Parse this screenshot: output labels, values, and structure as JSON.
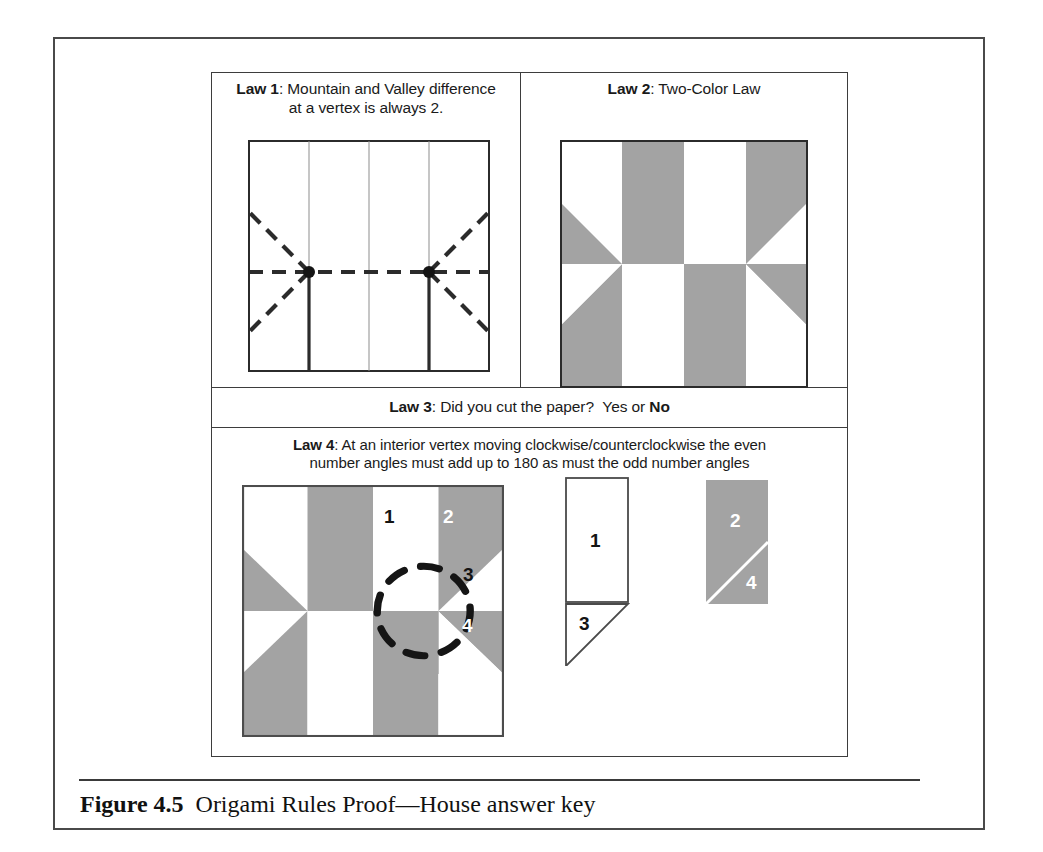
{
  "figure": {
    "caption_label": "Figure 4.5",
    "caption_text": "Origami Rules Proof—House answer key"
  },
  "colors": {
    "gray_fill": "#a3a3a3",
    "line": "#2b2b2b",
    "frame": "#4a4a4a",
    "white": "#ffffff"
  },
  "laws": {
    "law1": {
      "tag": "Law 1",
      "sep": ": ",
      "text_line1": "Mountain and Valley difference",
      "text_line2": "at a vertex is always 2.",
      "diagram": {
        "type": "crease-pattern",
        "columns": 4,
        "vertices": 2,
        "mountain_color": "#2b2b2b",
        "valley_style": "dashed"
      }
    },
    "law2": {
      "tag": "Law 2",
      "sep": ": ",
      "text_line1": "Two-Color Law",
      "diagram": {
        "type": "two-color-grid",
        "columns": 4,
        "rows": 2
      }
    },
    "law3": {
      "tag": "Law 3",
      "sep": ": ",
      "question": "Did you cut the paper?",
      "answer_prefix": "Yes or ",
      "answer": "No"
    },
    "law4": {
      "tag": "Law 4",
      "sep": ": ",
      "text_line1": "At an interior vertex moving clockwise/counterclockwise the even",
      "text_line2": "number angles must add up to 180 as must the odd number angles",
      "angle_labels": [
        "1",
        "2",
        "3",
        "4"
      ],
      "figure_a_labels": [
        "1",
        "3"
      ],
      "figure_b_labels": [
        "2",
        "4"
      ],
      "highlight": "dashed-circle"
    }
  }
}
